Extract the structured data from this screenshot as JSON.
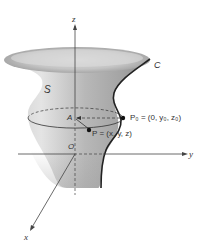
{
  "diagram": {
    "axes": {
      "z": "z",
      "y": "y",
      "x": "x",
      "origin": "O"
    },
    "surface_label": "S",
    "curve_label": "C",
    "points": {
      "A": "A",
      "P0": "P₀ = (0, y₀, z₀)",
      "P": "P = (x, y, z)"
    },
    "colors": {
      "surface_light": "#e6e6e6",
      "surface_dark": "#9a9a9a",
      "curve": "#222222",
      "axis": "#444444",
      "background": "#ffffff"
    }
  }
}
